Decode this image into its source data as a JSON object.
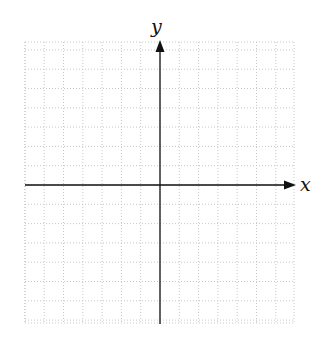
{
  "diagram": {
    "type": "coordinate-plane",
    "x_axis_label": "x",
    "y_axis_label": "y",
    "grid": {
      "left": 25,
      "right": 294,
      "top": 42,
      "bottom": 323,
      "origin_x": 160,
      "origin_y": 185,
      "cell": 19.3,
      "style": "dotted",
      "color": "#c8c8c8"
    },
    "axis_color": "#111111"
  },
  "chart_data": {
    "type": "scatter",
    "title": "",
    "xlabel": "x",
    "ylabel": "y",
    "grid": true,
    "series": [],
    "xlim": [
      -7,
      7
    ],
    "ylim": [
      -7,
      7
    ]
  }
}
